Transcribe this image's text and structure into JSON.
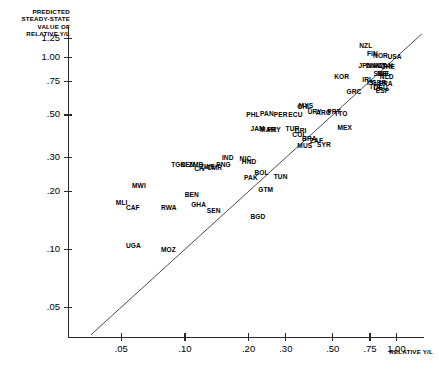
{
  "axes": {
    "ytitle": "PREDICTED\nSTEADY-STATE\nVALUE OF\nRELATIVE Y/L",
    "xtitle": "RELATIVE Y/L",
    "yticks": [
      "1.25",
      "1.00",
      ".75",
      ".50",
      ".30",
      ".20",
      ".10",
      ".05"
    ],
    "xticks": [
      ".05",
      ".10",
      ".20",
      ".30",
      ".50",
      ".75",
      "1.00"
    ]
  },
  "chart_data": {
    "type": "scatter",
    "title": "",
    "xlabel": "RELATIVE Y/L",
    "ylabel": "PREDICTED STEADY-STATE VALUE OF RELATIVE Y/L",
    "xscale": "log",
    "yscale": "log",
    "xlim": [
      0.028,
      1.35
    ],
    "ylim": [
      0.035,
      1.45
    ],
    "xtick_values": [
      0.05,
      0.1,
      0.2,
      0.3,
      0.5,
      0.75,
      1.0
    ],
    "ytick_values": [
      0.05,
      0.1,
      0.2,
      0.3,
      0.5,
      0.75,
      1.0,
      1.25
    ],
    "grid": false,
    "legend": null,
    "reference_line": {
      "type": "45-degree",
      "label": "y = x"
    },
    "point_label_type": "country-code",
    "points": [
      {
        "label": "NZL",
        "x": 0.735,
        "y": 1.15
      },
      {
        "label": "FIN",
        "x": 0.8,
        "y": 1.04
      },
      {
        "label": "NOR",
        "x": 0.855,
        "y": 1.02
      },
      {
        "label": "USA",
        "x": 1.0,
        "y": 1.01
      },
      {
        "label": "JPN",
        "x": 0.73,
        "y": 0.905
      },
      {
        "label": "DNK",
        "x": 0.79,
        "y": 0.9
      },
      {
        "label": "AUT",
        "x": 0.845,
        "y": 0.905
      },
      {
        "label": "CAN",
        "x": 0.905,
        "y": 0.9
      },
      {
        "label": "CHE",
        "x": 0.93,
        "y": 0.895
      },
      {
        "label": "SWE",
        "x": 0.86,
        "y": 0.825
      },
      {
        "label": "BEL",
        "x": 0.895,
        "y": 0.82
      },
      {
        "label": "NLD",
        "x": 0.92,
        "y": 0.795
      },
      {
        "label": "IRL",
        "x": 0.76,
        "y": 0.76
      },
      {
        "label": "ISL",
        "x": 0.8,
        "y": 0.74
      },
      {
        "label": "GBR",
        "x": 0.84,
        "y": 0.735
      },
      {
        "label": "FRA",
        "x": 0.91,
        "y": 0.73
      },
      {
        "label": "KOR",
        "x": 0.56,
        "y": 0.79
      },
      {
        "label": "ITA",
        "x": 0.83,
        "y": 0.7
      },
      {
        "label": "DEU",
        "x": 0.86,
        "y": 0.695
      },
      {
        "label": "ESP",
        "x": 0.88,
        "y": 0.67
      },
      {
        "label": "GRC",
        "x": 0.64,
        "y": 0.66
      },
      {
        "label": "PRT",
        "x": 0.52,
        "y": 0.52
      },
      {
        "label": "TTO",
        "x": 0.56,
        "y": 0.51
      },
      {
        "label": "CMR",
        "x": 0.14,
        "y": 0.265
      },
      {
        "label": "MYS",
        "x": 0.38,
        "y": 0.56
      },
      {
        "label": "CHL",
        "x": 0.375,
        "y": 0.555
      },
      {
        "label": "URY",
        "x": 0.42,
        "y": 0.52
      },
      {
        "label": "ARG",
        "x": 0.46,
        "y": 0.515
      },
      {
        "label": "PER",
        "x": 0.29,
        "y": 0.5
      },
      {
        "label": "PAN",
        "x": 0.25,
        "y": 0.51
      },
      {
        "label": "PHL",
        "x": 0.215,
        "y": 0.505
      },
      {
        "label": "ECU",
        "x": 0.34,
        "y": 0.5
      },
      {
        "label": "JAM",
        "x": 0.225,
        "y": 0.425
      },
      {
        "label": "MAR",
        "x": 0.25,
        "y": 0.42
      },
      {
        "label": "PRY",
        "x": 0.27,
        "y": 0.42
      },
      {
        "label": "TUR",
        "x": 0.33,
        "y": 0.425
      },
      {
        "label": "CRI",
        "x": 0.365,
        "y": 0.415
      },
      {
        "label": "COL",
        "x": 0.355,
        "y": 0.395
      },
      {
        "label": "MEX",
        "x": 0.58,
        "y": 0.43
      },
      {
        "label": "BRA",
        "x": 0.395,
        "y": 0.375
      },
      {
        "label": "ZAF",
        "x": 0.43,
        "y": 0.37
      },
      {
        "label": "MUS",
        "x": 0.375,
        "y": 0.345
      },
      {
        "label": "SYR",
        "x": 0.465,
        "y": 0.35
      },
      {
        "label": "IND",
        "x": 0.165,
        "y": 0.3
      },
      {
        "label": "NIC",
        "x": 0.2,
        "y": 0.295
      },
      {
        "label": "HND",
        "x": 0.205,
        "y": 0.285
      },
      {
        "label": "PNG",
        "x": 0.155,
        "y": 0.275
      },
      {
        "label": "TGO",
        "x": 0.095,
        "y": 0.275
      },
      {
        "label": "KEN",
        "x": 0.105,
        "y": 0.275
      },
      {
        "label": "ZMB",
        "x": 0.115,
        "y": 0.275
      },
      {
        "label": "ZWE",
        "x": 0.13,
        "y": 0.27
      },
      {
        "label": "CIV",
        "x": 0.122,
        "y": 0.262
      },
      {
        "label": "BOL",
        "x": 0.235,
        "y": 0.25
      },
      {
        "label": "PAK",
        "x": 0.21,
        "y": 0.235
      },
      {
        "label": "TUN",
        "x": 0.29,
        "y": 0.24
      },
      {
        "label": "GTM",
        "x": 0.245,
        "y": 0.205
      },
      {
        "label": "MWI",
        "x": 0.062,
        "y": 0.215
      },
      {
        "label": "BEN",
        "x": 0.11,
        "y": 0.192
      },
      {
        "label": "MLI",
        "x": 0.052,
        "y": 0.175
      },
      {
        "label": "GHA",
        "x": 0.118,
        "y": 0.172
      },
      {
        "label": "CAF",
        "x": 0.058,
        "y": 0.165
      },
      {
        "label": "RWA",
        "x": 0.085,
        "y": 0.165
      },
      {
        "label": "SEN",
        "x": 0.14,
        "y": 0.16
      },
      {
        "label": "BGD",
        "x": 0.225,
        "y": 0.148
      },
      {
        "label": "UGA",
        "x": 0.058,
        "y": 0.105
      },
      {
        "label": "MOZ",
        "x": 0.085,
        "y": 0.1
      }
    ]
  }
}
